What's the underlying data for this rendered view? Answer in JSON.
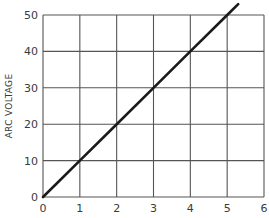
{
  "chart_data": {
    "type": "line",
    "title": "",
    "xlabel": "",
    "ylabel": "ARC VOLTAGE",
    "xlim": [
      0,
      6
    ],
    "ylim": [
      0,
      50
    ],
    "x_ticks": [
      "0",
      "1",
      "2",
      "3",
      "4",
      "5",
      "6"
    ],
    "y_ticks": [
      "0",
      "10",
      "20",
      "30",
      "40",
      "50"
    ],
    "grid": true,
    "legend": null,
    "series": [
      {
        "name": "Arc voltage",
        "x": [
          0,
          1,
          2,
          3,
          4,
          5,
          5.3
        ],
        "y": [
          0,
          10,
          20,
          30,
          40,
          50,
          53
        ]
      }
    ],
    "colors": {
      "line": "#1a1a1a",
      "grid": "#555555",
      "text": "#3a3a3a"
    }
  }
}
